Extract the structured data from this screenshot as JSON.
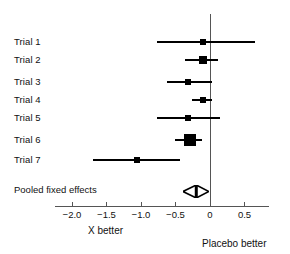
{
  "chart_data": {
    "type": "forest",
    "title": "",
    "xlabel": "",
    "ylabel": "",
    "xlim": [
      -2.25,
      0.85
    ],
    "grid": false,
    "legend": "none",
    "reference_line": 0,
    "xticks": [
      -2.0,
      -1.5,
      -1.0,
      -0.5,
      0,
      0.5
    ],
    "xtick_labels": [
      "−2.0",
      "−1.5",
      "−1.0",
      "−0.5",
      "0",
      "0.5"
    ],
    "left_caption": "X better",
    "right_caption": "Placebo better",
    "studies": [
      {
        "label": "Trial 1",
        "estimate": -0.1,
        "ci_low": -0.77,
        "ci_high": 0.65,
        "weight": 1.0
      },
      {
        "label": "Trial 2",
        "estimate": -0.1,
        "ci_low": -0.36,
        "ci_high": 0.12,
        "weight": 2.2
      },
      {
        "label": "Trial 3",
        "estimate": -0.32,
        "ci_low": -0.62,
        "ci_high": 0.03,
        "weight": 1.5
      },
      {
        "label": "Trial 4",
        "estimate": -0.1,
        "ci_low": -0.26,
        "ci_high": 0.03,
        "weight": 1.3
      },
      {
        "label": "Trial 5",
        "estimate": -0.32,
        "ci_low": -0.77,
        "ci_high": 0.14,
        "weight": 1.3
      },
      {
        "label": "Trial 6",
        "estimate": -0.29,
        "ci_low": -0.51,
        "ci_high": -0.12,
        "weight": 4.2
      },
      {
        "label": "Trial 7",
        "estimate": -1.06,
        "ci_low": -1.7,
        "ci_high": -0.43,
        "weight": 1.4
      }
    ],
    "pooled": {
      "label": "Pooled fixed effects",
      "estimate": -0.2,
      "ci_low": -0.32,
      "ci_high": -0.09
    }
  },
  "colors": {
    "marker": "#000000",
    "line": "#000000",
    "axis": "#555555",
    "text": "#111111",
    "background": "#ffffff"
  }
}
